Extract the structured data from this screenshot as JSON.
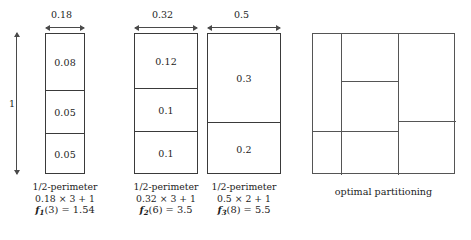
{
  "figure": {
    "background": "#ffffff",
    "stroke_color": "#3a3a3a",
    "text_color": "#1c1c1c"
  },
  "vertical_dimension": {
    "label": "1"
  },
  "panels": [
    {
      "id": "panel-1",
      "width_label": "0.18",
      "cells": [
        "0.08",
        "0.05",
        "0.05"
      ],
      "caption": {
        "line1": "1/2-perimeter",
        "line2": "0.18 × 3 + 1",
        "f_symbol": "f",
        "f_subscript": "1",
        "f_arg": "(3)",
        "f_eq": "= 1.54",
        "line3": "f1(3) = 1.54"
      }
    },
    {
      "id": "panel-2",
      "width_label": "0.32",
      "cells": [
        "0.12",
        "0.1",
        "0.1"
      ],
      "caption": {
        "line1": "1/2-perimeter",
        "line2": "0.32 × 3 + 1",
        "f_symbol": "f",
        "f_subscript": "2",
        "f_arg": "(6)",
        "f_eq": "= 3.5",
        "line3": "f2(6) = 3.5"
      }
    },
    {
      "id": "panel-3",
      "width_label": "0.5",
      "cells": [
        "0.3",
        "0.2"
      ],
      "caption": {
        "line1": "1/2-perimeter",
        "line2": "0.5 × 2 + 1",
        "f_symbol": "f",
        "f_subscript": "3",
        "f_arg": "(8)",
        "f_eq": "= 5.5",
        "line3": "f3(8) = 5.5"
      }
    }
  ],
  "optimal": {
    "caption": "optimal partitioning",
    "regions": [
      {
        "name": "left-top"
      },
      {
        "name": "left-middle"
      },
      {
        "name": "left-bottom"
      },
      {
        "name": "center-top"
      },
      {
        "name": "center-middle"
      },
      {
        "name": "center-bottom"
      },
      {
        "name": "right-top"
      },
      {
        "name": "right-bottom"
      }
    ]
  }
}
